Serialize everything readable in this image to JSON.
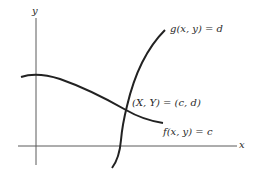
{
  "diagram": {
    "axes": {
      "x_label": "x",
      "y_label": "y",
      "color": "#5a5a5a"
    },
    "curves": [
      {
        "name": "f",
        "label": "f(x, y) = c",
        "color": "#222222"
      },
      {
        "name": "g",
        "label": "g(x, y) = d",
        "color": "#222222"
      }
    ],
    "intersection": {
      "label": "(X, Y) = (c, d)"
    }
  }
}
